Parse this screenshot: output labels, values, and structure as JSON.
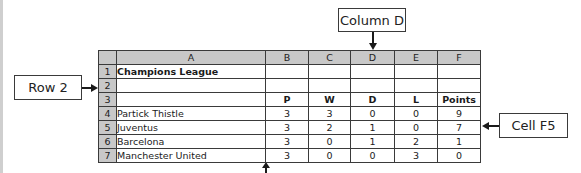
{
  "callouts": {
    "column_d": "Column D",
    "row_2": "Row 2",
    "cell_f5": "Cell F5"
  },
  "spreadsheet": {
    "column_headers": [
      "A",
      "B",
      "C",
      "D",
      "E",
      "F"
    ],
    "rows": [
      {
        "num": "1",
        "cells": [
          "Champions League",
          "",
          "",
          "",
          "",
          ""
        ]
      },
      {
        "num": "2",
        "cells": [
          "",
          "",
          "",
          "",
          "",
          ""
        ]
      },
      {
        "num": "3",
        "cells": [
          "",
          "P",
          "W",
          "D",
          "L",
          "Points"
        ]
      },
      {
        "num": "4",
        "cells": [
          "Partick Thistle",
          "3",
          "3",
          "0",
          "0",
          "9"
        ]
      },
      {
        "num": "5",
        "cells": [
          "Juventus",
          "3",
          "2",
          "1",
          "0",
          "7"
        ]
      },
      {
        "num": "6",
        "cells": [
          "Barcelona",
          "3",
          "0",
          "1",
          "2",
          "1"
        ]
      },
      {
        "num": "7",
        "cells": [
          "Manchester United",
          "3",
          "0",
          "0",
          "3",
          "0"
        ]
      }
    ]
  },
  "colors": {
    "header_bg": "#c8c8c8",
    "grid_line": "#3a3a3a"
  }
}
